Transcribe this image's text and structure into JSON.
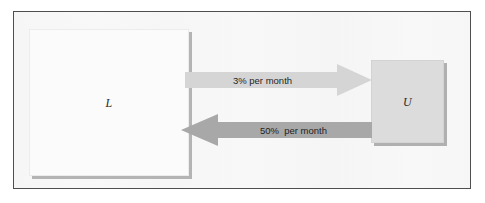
{
  "diagram": {
    "background_color": "#f7f7f7",
    "frame_color": "#4f4f4f",
    "nodes": [
      {
        "id": "L",
        "label": "L",
        "description": "Employed / labor force box",
        "fill_color": "#fbfbfb",
        "shadow_color": "#b4b4b4"
      },
      {
        "id": "U",
        "label": "U",
        "description": "Unemployed box",
        "fill_color": "#dcdcdc",
        "shadow_color": "#b0b0b0"
      }
    ],
    "flows": [
      {
        "id": "l-to-u",
        "label": "3% per month",
        "direction": "right",
        "from": "L",
        "to": "U",
        "color": "#d5d5d5"
      },
      {
        "id": "u-to-l",
        "label": "50%  per month",
        "direction": "left",
        "from": "U",
        "to": "L",
        "color": "#a8a8a8"
      }
    ]
  }
}
